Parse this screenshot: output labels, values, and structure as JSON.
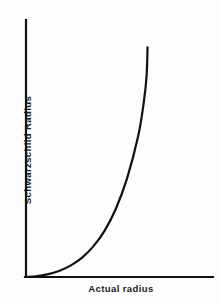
{
  "chart_data": {
    "type": "line",
    "title": "",
    "subtitle": "",
    "xlabel": "Actual radius",
    "ylabel": "Schwarzschild Radius",
    "xticks": [],
    "yticks": [],
    "xtick_labels": [],
    "ytick_labels": [],
    "grid": false,
    "legend": null,
    "annotations": [],
    "xlim": [
      0,
      1
    ],
    "ylim": [
      0,
      1
    ],
    "series": [
      {
        "name": "schwarzschild-vs-actual-radius",
        "color": "#111111",
        "linewidth": 2.2,
        "x": [
          0.0,
          0.06,
          0.12,
          0.18,
          0.24,
          0.3,
          0.36,
          0.42,
          0.48,
          0.54,
          0.6,
          0.63,
          0.645,
          0.65
        ],
        "y": [
          0.0,
          0.004,
          0.012,
          0.026,
          0.048,
          0.08,
          0.126,
          0.19,
          0.28,
          0.405,
          0.58,
          0.72,
          0.83,
          0.945
        ]
      }
    ],
    "axis_color": "#111111",
    "background_color": "#fdfdfd"
  },
  "figure": {
    "background": "#fdfdfd",
    "axis_color": "#111111",
    "curve_color": "#111111"
  }
}
